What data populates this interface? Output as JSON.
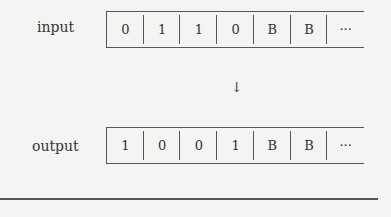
{
  "diagram": {
    "input": {
      "label": "input",
      "cells": [
        "0",
        "1",
        "1",
        "0",
        "B",
        "B",
        "···"
      ]
    },
    "arrow": "↓",
    "output": {
      "label": "output",
      "cells": [
        "1",
        "0",
        "0",
        "1",
        "B",
        "B",
        "···"
      ]
    }
  },
  "colors": {
    "background": "#f4f4f2",
    "line": "#555555",
    "text": "#333333"
  }
}
